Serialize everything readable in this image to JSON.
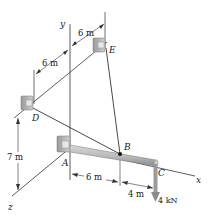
{
  "points": {
    "A": "A",
    "B": "B",
    "C": "C",
    "D": "D",
    "E": "E"
  },
  "axes": {
    "x": "x",
    "y": "y",
    "z": "z"
  },
  "dimensions": {
    "top_E_to_y": "6 m",
    "D_to_y": "6 m",
    "vertical_D_height": "7 m",
    "A_to_B": "6 m",
    "B_to_C": "4 m"
  },
  "load": {
    "label": "4 kN",
    "direction": "down"
  },
  "colors": {
    "line": "#333333",
    "beam": "#b8b8b8",
    "support": "#a9a9a9"
  }
}
